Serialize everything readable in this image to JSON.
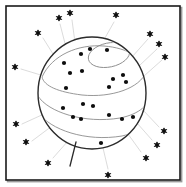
{
  "figure": {
    "canvas": {
      "width": 186,
      "height": 187,
      "background": "#ffffff"
    }
  },
  "frame": {
    "name": "outer-border",
    "x": 6,
    "y": 6,
    "width": 174,
    "height": 174,
    "stroke": "#1a1a1a",
    "stroke_width": 1.6,
    "fill": "#ffffff",
    "shadow": {
      "offset_x": 1.6,
      "offset_y": 1.6,
      "color": "#9a9a9a"
    }
  },
  "sphere": {
    "name": "sphere-body",
    "center_x": 92,
    "center_y": 93,
    "radius_x": 54,
    "radius_y": 56,
    "stroke": "#2b2b2b",
    "stroke_width": 1.4,
    "fill": "#ffffff"
  },
  "latitudes": [
    {
      "name": "latitude-top-small",
      "cx": 109,
      "cy": 55,
      "rx": 21,
      "ry": 12,
      "rotate": -12,
      "stroke": "#8c8c8c",
      "stroke_width": 0.9
    },
    {
      "name": "latitude-upper",
      "d": "M 42 77 C 52 55, 78 44, 104 46 C 128 48, 144 58, 146 72 C 140 88, 112 98, 82 95 C 58 92, 44 86, 42 77 Z",
      "stroke": "#8c8c8c",
      "stroke_width": 0.9
    },
    {
      "name": "latitude-middle",
      "d": "M 38 96 C 48 112, 84 124, 120 118 C 140 114, 150 104, 150 94",
      "stroke": "#8c8c8c",
      "stroke_width": 0.9
    },
    {
      "name": "latitude-lower",
      "d": "M 38 112 C 50 130, 86 142, 122 136 C 140 132, 148 122, 148 112",
      "stroke": "#8c8c8c",
      "stroke_width": 0.9
    }
  ],
  "stem": {
    "name": "sphere-stem",
    "d": "M 76 142 L 70 166",
    "stroke": "#2b2b2b",
    "stroke_width": 1.3
  },
  "dots": {
    "name": "surface-dots",
    "color": "#0d0d0d",
    "radius": 2.1,
    "points": [
      {
        "x": 81,
        "y": 54
      },
      {
        "x": 107,
        "y": 50
      },
      {
        "x": 64,
        "y": 63
      },
      {
        "x": 90,
        "y": 49
      },
      {
        "x": 70,
        "y": 73
      },
      {
        "x": 82,
        "y": 71
      },
      {
        "x": 113,
        "y": 79
      },
      {
        "x": 123,
        "y": 75
      },
      {
        "x": 126,
        "y": 82
      },
      {
        "x": 109,
        "y": 87
      },
      {
        "x": 66,
        "y": 88
      },
      {
        "x": 83,
        "y": 104
      },
      {
        "x": 63,
        "y": 108
      },
      {
        "x": 93,
        "y": 106
      },
      {
        "x": 73,
        "y": 117
      },
      {
        "x": 81,
        "y": 119
      },
      {
        "x": 109,
        "y": 115
      },
      {
        "x": 122,
        "y": 119
      },
      {
        "x": 133,
        "y": 117
      },
      {
        "x": 101,
        "y": 143
      }
    ]
  },
  "stars": {
    "name": "surrounding-stars",
    "color": "#0d0d0d",
    "size": 6.2,
    "points": [
      {
        "x": 59,
        "y": 18
      },
      {
        "x": 70,
        "y": 13
      },
      {
        "x": 38,
        "y": 33
      },
      {
        "x": 116,
        "y": 15
      },
      {
        "x": 150,
        "y": 34
      },
      {
        "x": 159,
        "y": 44
      },
      {
        "x": 165,
        "y": 57
      },
      {
        "x": 15,
        "y": 67
      },
      {
        "x": 16,
        "y": 124
      },
      {
        "x": 26,
        "y": 142
      },
      {
        "x": 48,
        "y": 163
      },
      {
        "x": 108,
        "y": 175
      },
      {
        "x": 164,
        "y": 131
      },
      {
        "x": 157,
        "y": 145
      },
      {
        "x": 146,
        "y": 158
      }
    ]
  },
  "rays": {
    "name": "light-rays",
    "stroke": "#d2d2d2",
    "stroke_width": 0.8,
    "lines": [
      {
        "x1": 68,
        "y1": 55,
        "x2": 60,
        "y2": 24
      },
      {
        "x1": 76,
        "y1": 50,
        "x2": 72,
        "y2": 20
      },
      {
        "x1": 58,
        "y1": 62,
        "x2": 43,
        "y2": 38
      },
      {
        "x1": 101,
        "y1": 45,
        "x2": 114,
        "y2": 22
      },
      {
        "x1": 132,
        "y1": 57,
        "x2": 148,
        "y2": 39
      },
      {
        "x1": 139,
        "y1": 66,
        "x2": 157,
        "y2": 49
      },
      {
        "x1": 144,
        "y1": 76,
        "x2": 162,
        "y2": 60
      },
      {
        "x1": 44,
        "y1": 76,
        "x2": 21,
        "y2": 69
      },
      {
        "x1": 44,
        "y1": 114,
        "x2": 22,
        "y2": 124
      },
      {
        "x1": 52,
        "y1": 126,
        "x2": 32,
        "y2": 141
      },
      {
        "x1": 68,
        "y1": 141,
        "x2": 53,
        "y2": 158
      },
      {
        "x1": 103,
        "y1": 148,
        "x2": 108,
        "y2": 169
      },
      {
        "x1": 143,
        "y1": 110,
        "x2": 159,
        "y2": 127
      },
      {
        "x1": 137,
        "y1": 123,
        "x2": 152,
        "y2": 140
      },
      {
        "x1": 128,
        "y1": 134,
        "x2": 141,
        "y2": 152
      }
    ]
  }
}
